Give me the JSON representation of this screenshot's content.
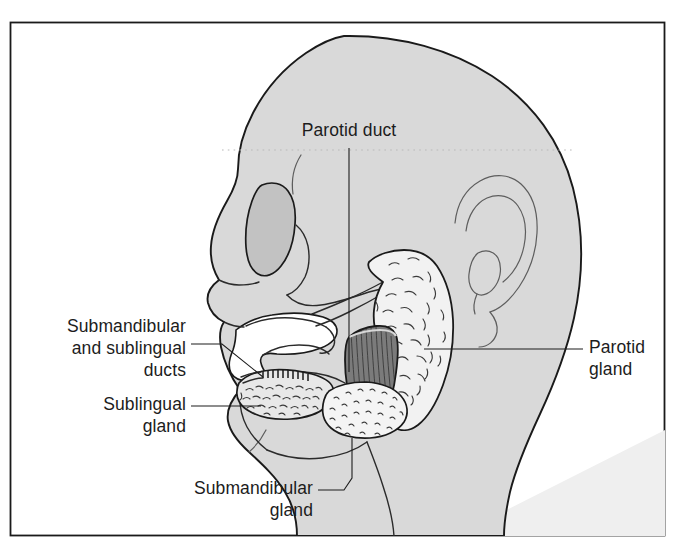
{
  "figure": {
    "title": "Salivary glands of the head (lateral view)",
    "frame": {
      "border_color": "#1a1a1a",
      "background_color": "#ffffff"
    },
    "palette": {
      "head_fill": "#d9d9d9",
      "head_outline": "#1a1a1a",
      "eye_socket_fill": "#c2c2c2",
      "gland_fill": "#f2f2f2",
      "masseter_fill": "#7c7c7c",
      "oral_cavity_fill": "#ffffff",
      "label_text": "#1c1c1c",
      "leader_line": "#1c1c1c",
      "thin_line": "#5d5d5d",
      "shadow_fill": "#efefef"
    },
    "labels": [
      {
        "id": "parotid-duct",
        "text_lines": [
          "Parotid duct"
        ],
        "align": "center",
        "x": 349,
        "y": 136,
        "leader": "vertical line descending from label to the parotid duct"
      },
      {
        "id": "submandibular-and-sublingual-ducts",
        "text_lines": [
          "Submandibular",
          "and sublingual",
          "ducts"
        ],
        "align": "right",
        "x": 186,
        "y": 332,
        "leader": "diagonal line to the duct openings under the tongue"
      },
      {
        "id": "sublingual-gland",
        "text_lines": [
          "Sublingual",
          "gland"
        ],
        "align": "right",
        "x": 186,
        "y": 410,
        "leader": "horizontal line to the sublingual gland"
      },
      {
        "id": "submandibular-gland",
        "text_lines": [
          "Submandibular",
          "gland"
        ],
        "align": "right",
        "x": 313,
        "y": 494,
        "leader": "angled line up and right to the submandibular gland"
      },
      {
        "id": "parotid-gland",
        "text_lines": [
          "Parotid",
          "gland"
        ],
        "align": "left",
        "x": 589,
        "y": 353,
        "leader": "horizontal line left to the parotid gland"
      }
    ],
    "structures": [
      {
        "id": "head-profile",
        "name": "head and neck profile",
        "fill": "#d9d9d9"
      },
      {
        "id": "eye-socket",
        "name": "orbit / eye socket",
        "fill": "#c2c2c2"
      },
      {
        "id": "ear",
        "name": "external ear (auricle)",
        "fill": "none"
      },
      {
        "id": "oral-cavity",
        "name": "oral cavity and tongue space",
        "fill": "#ffffff"
      },
      {
        "id": "parotid-gland",
        "name": "parotid gland",
        "fill": "#f2f2f2",
        "texture": "stippled dashes"
      },
      {
        "id": "parotid-duct",
        "name": "parotid (Stensen) duct",
        "fill": "none"
      },
      {
        "id": "masseter-muscle",
        "name": "masseter muscle",
        "fill": "#7c7c7c",
        "texture": "vertical striations"
      },
      {
        "id": "sublingual-gland",
        "name": "sublingual gland",
        "fill": "#e8e8e8",
        "texture": "dense dark flecks"
      },
      {
        "id": "submandibular-gland",
        "name": "submandibular gland",
        "fill": "#f4f4f4",
        "texture": "fine dots"
      },
      {
        "id": "submandibular-sublingual-ducts",
        "name": "submandibular and sublingual ducts",
        "fill": "none"
      }
    ]
  }
}
